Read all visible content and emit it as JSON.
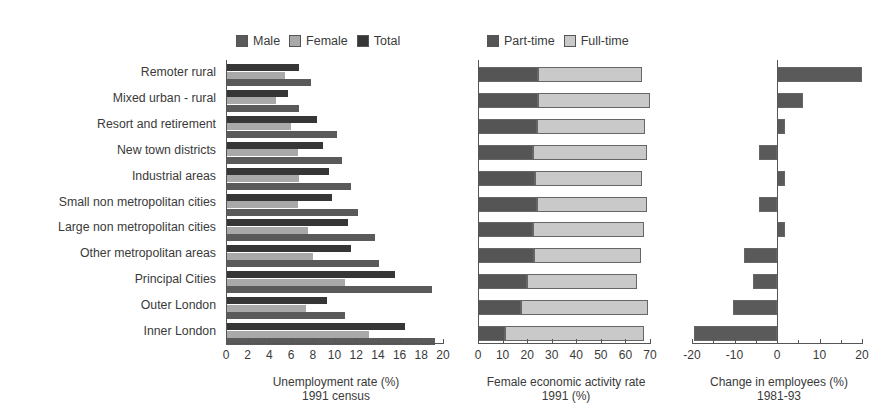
{
  "chart_data": [
    {
      "type": "bar",
      "orientation": "horizontal",
      "title": "",
      "xlabel": "Unemployment rate (%) 1991 census",
      "xlabel_lines": [
        "Unemployment rate (%)",
        "1991 census"
      ],
      "ylabel": "",
      "xlim": [
        0,
        20
      ],
      "xticks": [
        0,
        2,
        4,
        6,
        8,
        10,
        12,
        14,
        16,
        18,
        20
      ],
      "legend": [
        "Male",
        "Female",
        "Total"
      ],
      "legend_position": "top",
      "categories": [
        "Remoter rural",
        "Mixed urban - rural",
        "Resort and retirement",
        "New town districts",
        "Industrial areas",
        "Small non metropolitan cities",
        "Large non metropolitan cities",
        "Other metropolitan areas",
        "Principal Cities",
        "Outer London",
        "Inner London"
      ],
      "series": [
        {
          "name": "Total",
          "color": "#363636",
          "values": [
            6.7,
            5.7,
            8.4,
            8.9,
            9.5,
            9.8,
            11.2,
            11.5,
            15.6,
            9.3,
            16.5
          ]
        },
        {
          "name": "Female",
          "color": "#a9a9a9",
          "values": [
            5.4,
            4.6,
            6.0,
            6.6,
            6.7,
            6.6,
            7.6,
            8.0,
            11.0,
            7.4,
            13.2
          ]
        },
        {
          "name": "Male",
          "color": "#5a5a5a",
          "values": [
            7.8,
            6.7,
            10.2,
            10.7,
            11.5,
            12.2,
            13.7,
            14.1,
            19.0,
            11.0,
            19.3
          ]
        }
      ]
    },
    {
      "type": "bar",
      "orientation": "horizontal",
      "stacked": true,
      "title": "",
      "xlabel": "Female economic activity rate 1991 (%)",
      "xlabel_lines": [
        "Female economic activity rate",
        "1991 (%)"
      ],
      "xlim": [
        0,
        70
      ],
      "xticks": [
        0,
        10,
        20,
        30,
        40,
        50,
        60,
        70
      ],
      "legend": [
        "Part-time",
        "Full-time"
      ],
      "legend_position": "top",
      "categories": [
        "Remoter rural",
        "Mixed urban - rural",
        "Resort and retirement",
        "New town districts",
        "Industrial areas",
        "Small non metropolitan cities",
        "Large non metropolitan cities",
        "Other metropolitan areas",
        "Principal Cities",
        "Outer London",
        "Inner London"
      ],
      "series": [
        {
          "name": "Part-time",
          "color": "#555555",
          "values": [
            24.4,
            24.4,
            24.0,
            22.4,
            23.2,
            24.0,
            22.4,
            22.8,
            20.0,
            17.5,
            11.0
          ]
        },
        {
          "name": "Full-time",
          "color": "#c9c9c9",
          "values": [
            42.3,
            45.6,
            44.0,
            46.4,
            43.5,
            44.8,
            45.2,
            43.5,
            44.7,
            51.7,
            56.6
          ]
        }
      ],
      "totals": [
        66.7,
        70.0,
        68.0,
        68.8,
        66.7,
        68.8,
        67.6,
        66.3,
        64.7,
        69.2,
        67.6
      ]
    },
    {
      "type": "bar",
      "orientation": "horizontal",
      "title": "",
      "xlabel": "Change in employees (%) 1981-93",
      "xlabel_lines": [
        "Change in employees (%)",
        "1981-93"
      ],
      "xlim": [
        -20,
        20
      ],
      "xticks": [
        -20,
        -10,
        0,
        10,
        20
      ],
      "xtick_labels": [
        "-20",
        "-10",
        "0",
        "10",
        "20"
      ],
      "categories": [
        "Remoter rural",
        "Mixed urban - rural",
        "Resort and retirement",
        "New town districts",
        "Industrial areas",
        "Small non metropolitan cities",
        "Large non metropolitan cities",
        "Other metropolitan areas",
        "Principal Cities",
        "Outer London",
        "Inner London"
      ],
      "series": [
        {
          "name": "Change in employees",
          "color": "#5a5a5a",
          "values": [
            20.0,
            6.1,
            1.9,
            -4.2,
            1.9,
            -4.2,
            1.9,
            -7.8,
            -5.6,
            -10.4,
            -19.5
          ]
        }
      ]
    }
  ]
}
